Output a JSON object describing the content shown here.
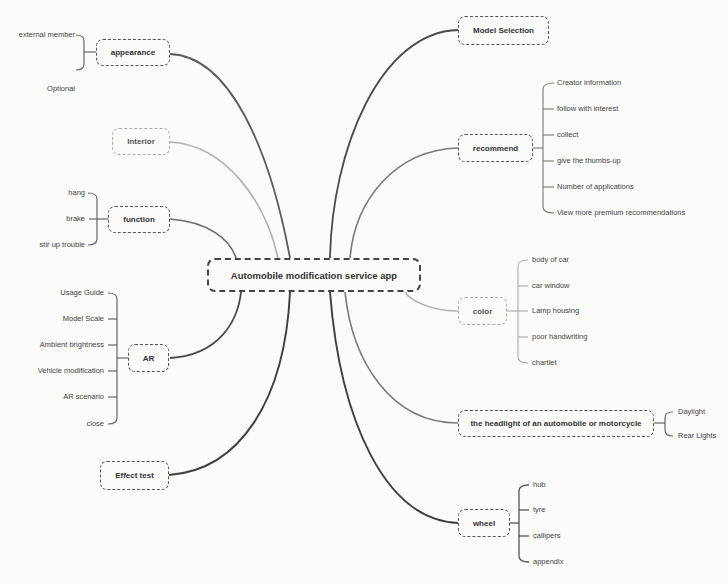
{
  "root": {
    "label": "Automobile modification service app"
  },
  "branches": {
    "appearance": {
      "label": "appearance",
      "children": [
        "external member",
        "Optional"
      ]
    },
    "interior": {
      "label": "Interior"
    },
    "function": {
      "label": "function",
      "children": [
        "hang",
        "brake",
        "stir up trouble"
      ]
    },
    "ar": {
      "label": "AR",
      "children": [
        "Usage Guide",
        "Model Scale",
        "Ambient brightness",
        "Vehicle modification",
        "AR scenario",
        "close"
      ]
    },
    "effect_test": {
      "label": "Effect test"
    },
    "model_selection": {
      "label": "Model Selection"
    },
    "recommend": {
      "label": "recommend",
      "children": [
        "Creator information",
        "follow with interest",
        "collect",
        "give the thumbs-up",
        "Number of applications",
        "View more premium recommendations"
      ]
    },
    "color": {
      "label": "color",
      "children": [
        "body of car",
        "car window",
        "Lamp housing",
        "poor handwriting",
        "chartlet"
      ]
    },
    "headlight": {
      "label": "the headlight of an automobile or motorcycle",
      "children": [
        "Daylight",
        "Rear Lights"
      ]
    },
    "wheel": {
      "label": "wheel",
      "children": [
        "hub",
        "tyre",
        "callipers",
        "appendix"
      ]
    }
  },
  "colors": {
    "dark_link": "#4a4a4a",
    "mid_link": "#7a7a7a",
    "light_link": "#b5b5b5",
    "background": "#fbfbfa"
  }
}
